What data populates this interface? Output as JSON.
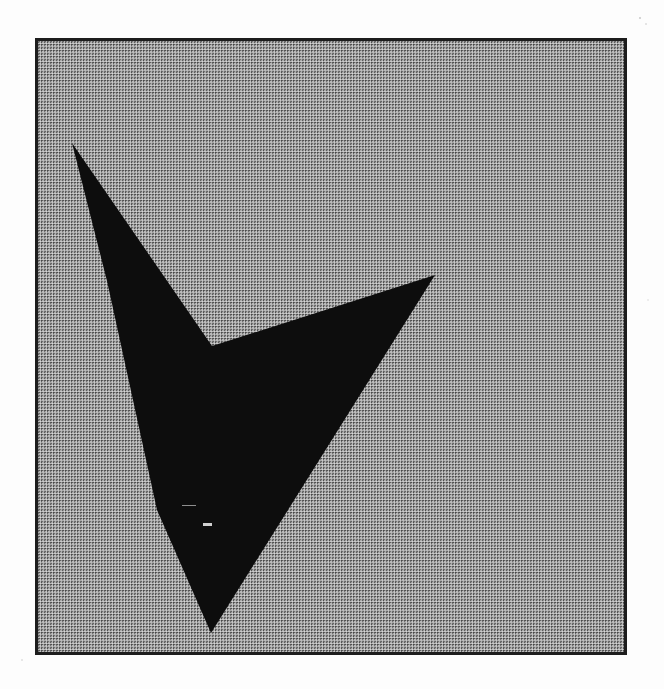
{
  "page": {
    "background_color": "#fdfdfd",
    "width": 664,
    "height": 689,
    "caption": ""
  },
  "figure": {
    "name": "black-arrow-polygon-figure",
    "frame": {
      "x": 35,
      "y": 38,
      "width": 592,
      "height": 617,
      "border_color": "#1d1d1d",
      "border_width": 3,
      "fill_color": "#a8a8a8",
      "fill_style": "halftone-gray-screen"
    },
    "shape": {
      "name": "checkmark-arrow-polygon",
      "fill_color": "#0d0d0d",
      "description": "solid black concave polygon resembling a stylized check mark or swept arrow",
      "points": [
        [
          72,
          143
        ],
        [
          212,
          346
        ],
        [
          435,
          275
        ],
        [
          211,
          633
        ],
        [
          157,
          510
        ],
        [
          107,
          281
        ]
      ],
      "vertex_labels": [
        "upper-left-tip",
        "inner-notch",
        "right-tip",
        "bottom-tip",
        "left-edge-inflection",
        "left-edge-upper"
      ]
    },
    "artifacts": [
      {
        "name": "scan-speck-lower-left",
        "x": 203,
        "y": 523,
        "width": 9,
        "height": 3
      },
      {
        "name": "scan-speck-mid-body",
        "x": 182,
        "y": 505,
        "width": 14,
        "height": 1
      }
    ]
  }
}
